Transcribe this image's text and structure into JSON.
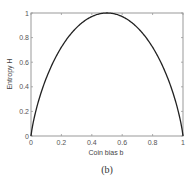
{
  "chart_data": {
    "type": "line",
    "title": "",
    "xlabel": "Coin bias b",
    "ylabel": "Entropy H",
    "caption": "(b)",
    "xlim": [
      0,
      1
    ],
    "ylim": [
      0,
      1
    ],
    "grid": false,
    "legend": null,
    "x_ticks": [
      "0",
      "0.2",
      "0.4",
      "0.6",
      "0.8",
      "1"
    ],
    "y_ticks": [
      "0",
      "0.2",
      "0.4",
      "0.6",
      "0.8",
      "1"
    ],
    "series": [
      {
        "name": "Binary entropy H(b)",
        "color": "#222222",
        "x": [
          0,
          0.01,
          0.05,
          0.1,
          0.15,
          0.2,
          0.25,
          0.3,
          0.35,
          0.4,
          0.45,
          0.5,
          0.55,
          0.6,
          0.65,
          0.7,
          0.75,
          0.8,
          0.85,
          0.9,
          0.95,
          0.99,
          1
        ],
        "values": [
          0,
          0.081,
          0.286,
          0.469,
          0.61,
          0.722,
          0.811,
          0.881,
          0.934,
          0.971,
          0.993,
          1.0,
          0.993,
          0.971,
          0.934,
          0.881,
          0.811,
          0.722,
          0.61,
          0.469,
          0.286,
          0.081,
          0
        ]
      }
    ]
  }
}
